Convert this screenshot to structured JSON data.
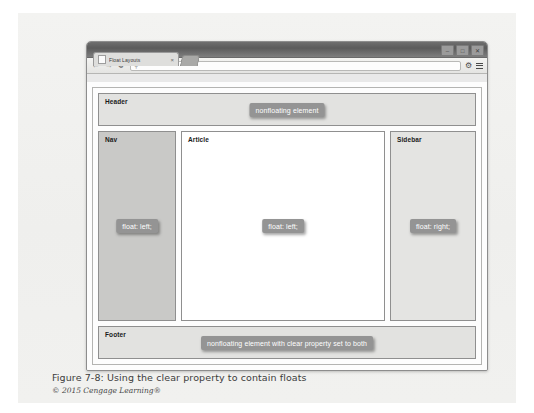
{
  "browser": {
    "window_controls": [
      {
        "name": "minimize",
        "glyph": "–"
      },
      {
        "name": "maximize",
        "glyph": "□"
      },
      {
        "name": "close",
        "glyph": "✕"
      }
    ],
    "tab": {
      "title": "Float Layouts",
      "close_glyph": "×"
    },
    "toolbar": {
      "back_glyph": "←",
      "forward_glyph": "→",
      "reload_glyph": "⟳",
      "address_search_glyph": "⚲",
      "address_value": "",
      "address_placeholder": "",
      "gear_glyph": "⚙"
    }
  },
  "page": {
    "header": {
      "label": "Header",
      "badge": "nonfloating element"
    },
    "nav": {
      "label": "Nav",
      "badge": "float: left;"
    },
    "article": {
      "label": "Article",
      "badge": "float: left;"
    },
    "sidebar": {
      "label": "Sidebar",
      "badge": "float: right;"
    },
    "footer": {
      "label": "Footer",
      "badge": "nonfloating element with clear property set to both"
    }
  },
  "figure": {
    "caption": "Figure 7-8: Using the clear property to contain floats",
    "credit": "© 2015 Cengage Learning®"
  },
  "colors": {
    "badge_bg": "#949494",
    "nav_bg": "#c9c9c7",
    "sidebar_bg": "#e4e4e2",
    "header_bg": "#e2e2e0",
    "article_bg": "#ffffff",
    "plate_bg": "#f2f2f0"
  }
}
